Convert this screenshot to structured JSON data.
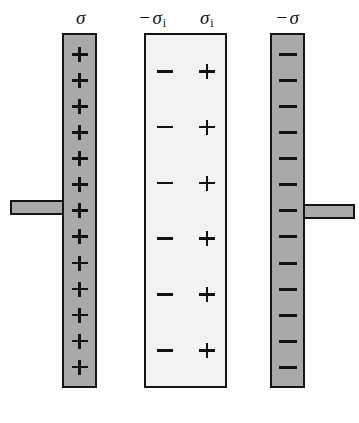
{
  "figure": {
    "background_color": "#ffffff"
  },
  "colors": {
    "plate_fill": "#a9a9a9",
    "dielectric_fill": "#f2f2f0",
    "outline": "#151515",
    "glyph": "#121212"
  },
  "labels": {
    "left_plate": {
      "sign": "",
      "symbol": "σ",
      "subscript": ""
    },
    "dielectric_left": {
      "sign": "−",
      "symbol": "σ",
      "subscript": "i"
    },
    "dielectric_right": {
      "sign": "",
      "symbol": "σ",
      "subscript": "i"
    },
    "right_plate": {
      "sign": "−",
      "symbol": "σ",
      "subscript": ""
    }
  },
  "left_plate": {
    "name": "left-conductor-plate",
    "fill": "#a9a9a9",
    "charge_sign": "+",
    "charge_count": 13,
    "charges": [
      "+",
      "+",
      "+",
      "+",
      "+",
      "+",
      "+",
      "+",
      "+",
      "+",
      "+",
      "+",
      "+"
    ]
  },
  "right_plate": {
    "name": "right-conductor-plate",
    "fill": "#a9a9a9",
    "charge_sign": "−",
    "charge_count": 13,
    "charges": [
      "-",
      "-",
      "-",
      "-",
      "-",
      "-",
      "-",
      "-",
      "-",
      "-",
      "-",
      "-",
      "-"
    ]
  },
  "dielectric_slab": {
    "name": "dielectric-slab",
    "fill": "#f2f2f0",
    "row_count": 6,
    "rows": [
      {
        "left": "-",
        "right": "+"
      },
      {
        "left": "-",
        "right": "+"
      },
      {
        "left": "-",
        "right": "+"
      },
      {
        "left": "-",
        "right": "+"
      },
      {
        "left": "-",
        "right": "+"
      },
      {
        "left": "-",
        "right": "+"
      }
    ]
  },
  "leads": {
    "left": {
      "name": "left-terminal-lead",
      "fill": "#a9a9a9"
    },
    "right": {
      "name": "right-terminal-lead",
      "fill": "#a9a9a9"
    }
  }
}
